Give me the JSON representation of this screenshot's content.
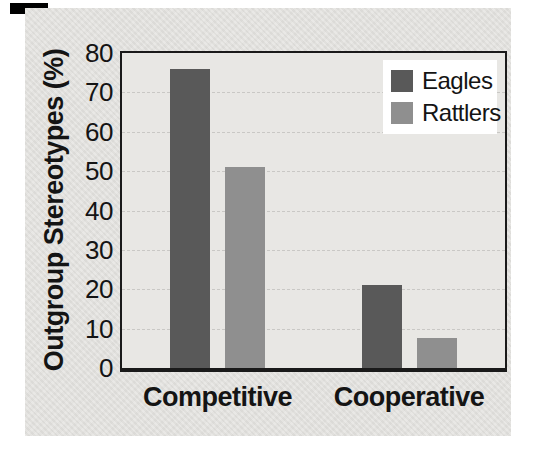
{
  "figure": {
    "corner_mark_color": "#000000",
    "panel_bg": "#e1e0dd",
    "plot_bg": "#e8e7e4",
    "border_color": "#1a1a1a",
    "gridline_color": "#c6c5c2",
    "text_color": "#141414",
    "legend_bg": "#ffffff"
  },
  "chart_data": {
    "type": "bar",
    "title": "",
    "ylabel": "Outgroup Stereotypes (%)",
    "xlabel": "",
    "categories": [
      "Competitive",
      "Cooperative"
    ],
    "series": [
      {
        "name": "Eagles",
        "color": "#595959",
        "values": [
          76,
          21
        ]
      },
      {
        "name": "Rattlers",
        "color": "#8f8f8f",
        "values": [
          51,
          7.5
        ]
      }
    ],
    "ylim": [
      0,
      80
    ],
    "yticks": [
      0,
      10,
      20,
      30,
      40,
      50,
      60,
      70,
      80
    ],
    "grid": "horizontal-dashed",
    "legend_position": "top-right"
  }
}
